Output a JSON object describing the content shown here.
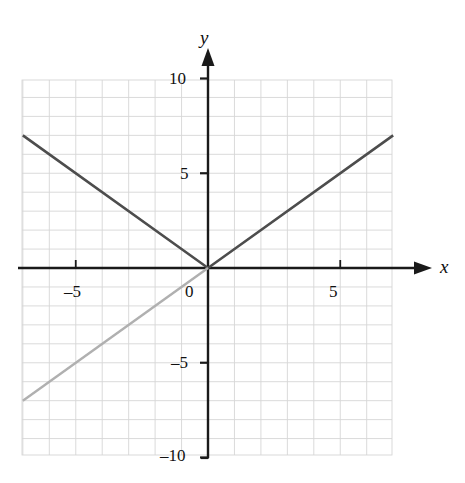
{
  "figure": {
    "kind": "coordinate-plane-graph",
    "background_color": "#ffffff",
    "grid_color": "#d6d6d6",
    "axis_color": "#1a1a1a"
  },
  "axes": {
    "x_axis_label": "x",
    "y_axis_label": "y",
    "origin_label": "0",
    "x_ticks": [
      {
        "value": -5,
        "label": "–5"
      },
      {
        "value": 5,
        "label": "5"
      }
    ],
    "y_ticks": [
      {
        "value": 10,
        "label": "10"
      },
      {
        "value": 5,
        "label": "5"
      },
      {
        "value": -5,
        "label": "–5"
      },
      {
        "value": -10,
        "label": "–10"
      }
    ]
  },
  "chart_data": {
    "type": "line",
    "title": "",
    "xlabel": "x",
    "ylabel": "y",
    "xlim": [
      -7,
      7
    ],
    "ylim": [
      -10,
      10
    ],
    "x_ticks": [
      -5,
      5
    ],
    "y_ticks": [
      -10,
      -5,
      5,
      10
    ],
    "grid": true,
    "grid_spacing": 1,
    "legend": "none",
    "series": [
      {
        "name": "y = |x|",
        "color": "#4d4d4d",
        "width": 2.6,
        "points": [
          {
            "x": -7,
            "y": 7
          },
          {
            "x": 0,
            "y": 0
          },
          {
            "x": 7,
            "y": 7
          }
        ]
      },
      {
        "name": "y = x (third-quadrant ray)",
        "color": "#b0b0b0",
        "width": 2.4,
        "points": [
          {
            "x": -7,
            "y": -7
          },
          {
            "x": 0,
            "y": 0
          }
        ]
      }
    ]
  }
}
